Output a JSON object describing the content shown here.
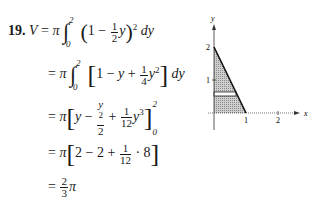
{
  "problem": {
    "number": "19.",
    "steps": [
      {
        "lhs": "V",
        "eq": "=",
        "expr": "π ∫₀² (1 − ½y)² dy"
      },
      {
        "eq": "=",
        "expr": "π ∫₀² [1 − y + ¼y²] dy"
      },
      {
        "eq": "=",
        "expr": "π [y − y²/2 + (1/12)y³]₀²"
      },
      {
        "eq": "=",
        "expr": "π [2 − 2 + (1/12) · 8]"
      },
      {
        "eq": "=",
        "expr": "(2/3)π"
      }
    ],
    "tokens": {
      "V": "V",
      "eq": "=",
      "pi": "π",
      "int": "∫",
      "zero": "0",
      "two": "2",
      "one": "1",
      "minus": "−",
      "plus": "+",
      "y": "y",
      "dy": "dy",
      "lparen": "(",
      "rparen": ")",
      "lbrack": "[",
      "rbrack": "]",
      "sq": "2",
      "cube": "3",
      "four": "4",
      "twelve": "12",
      "three": "3",
      "eight": "8",
      "dot": "·"
    }
  },
  "graph": {
    "x_axis_label": "x",
    "y_axis_label": "y",
    "x_ticks": [
      "1",
      "2"
    ],
    "y_ticks": [
      "1",
      "2"
    ],
    "region": "triangle bounded by x = 1 − y/2, x = 0, y = 0 (shaded) with horizontal strip",
    "line_endpoints": [
      [
        0,
        2
      ],
      [
        1,
        0
      ]
    ]
  }
}
